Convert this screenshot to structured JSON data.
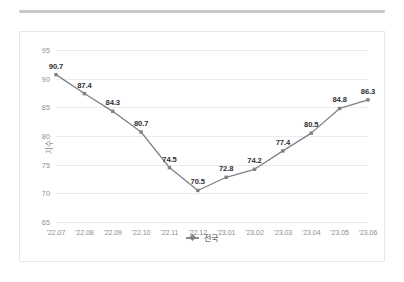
{
  "chart_data": {
    "type": "line",
    "title": "",
    "xlabel": "",
    "ylabel": "지수",
    "ylim": [
      65,
      95
    ],
    "yticks": [
      65,
      70,
      75,
      80,
      85,
      90,
      95
    ],
    "grid": true,
    "legend_position": "bottom",
    "categories": [
      "'22.07",
      "'22.08",
      "'22.09",
      "'22.10",
      "'22.11",
      "'22.12",
      "'23.01",
      "'23.02",
      "'23.03",
      "'23.04",
      "'23.05",
      "'23.06"
    ],
    "series": [
      {
        "name": "전국",
        "color": "#808088",
        "marker": "square",
        "values": [
          90.7,
          87.4,
          84.3,
          80.7,
          74.5,
          70.5,
          72.8,
          74.2,
          77.4,
          80.5,
          84.8,
          86.3
        ],
        "value_labels": [
          "90.7",
          "87.4",
          "84.3",
          "80.7",
          "74.5",
          "70.5",
          "72.8",
          "74.2",
          "77.4",
          "80.5",
          "84.8",
          "86.3"
        ]
      }
    ]
  },
  "legend": {
    "entries": [
      {
        "label": "전국"
      }
    ]
  }
}
